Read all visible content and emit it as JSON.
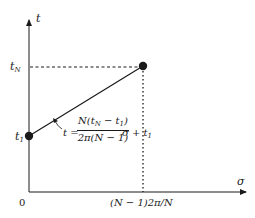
{
  "diagram": {
    "axes": {
      "y_label": "t",
      "x_label": "σ",
      "origin_label": "0"
    },
    "y_ticks": {
      "top": {
        "base": "t",
        "sub": "N"
      },
      "bottom": {
        "base": "t",
        "sub": "1"
      }
    },
    "x_tick": "(N − 1)2π/N",
    "equation": {
      "lhs": "t =",
      "numerator_prefix": "N(t",
      "numerator_sub_a": "N",
      "numerator_mid": " − t",
      "numerator_sub_b": "1",
      "numerator_suffix": ")",
      "denominator": "2π(N − 1)",
      "rhs": "σ + t",
      "rhs_sub": "1"
    },
    "points": [
      {
        "name": "start",
        "x": "0",
        "y": "t1"
      },
      {
        "name": "end",
        "x": "(N-1)2π/N",
        "y": "tN"
      }
    ],
    "colors": {
      "ink": "#1a1a1a",
      "background": "#ffffff"
    }
  }
}
